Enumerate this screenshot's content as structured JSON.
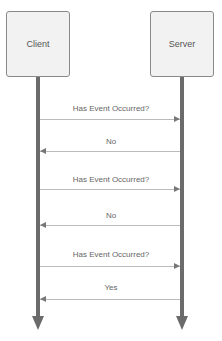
{
  "diagram": {
    "type": "sequence",
    "actors": [
      {
        "name": "Client"
      },
      {
        "name": "Server"
      }
    ],
    "messages": [
      {
        "from": "Client",
        "to": "Server",
        "label": "Has Event Occurred?"
      },
      {
        "from": "Server",
        "to": "Client",
        "label": "No"
      },
      {
        "from": "Client",
        "to": "Server",
        "label": "Has Event Occurred?"
      },
      {
        "from": "Server",
        "to": "Client",
        "label": "No"
      },
      {
        "from": "Client",
        "to": "Server",
        "label": "Has Event Occurred?"
      },
      {
        "from": "Server",
        "to": "Client",
        "label": "Yes"
      }
    ]
  }
}
